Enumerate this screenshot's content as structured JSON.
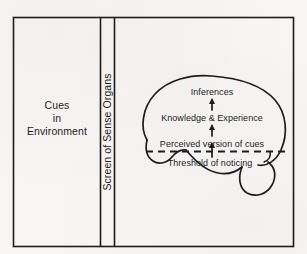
{
  "figure": {
    "ink_color": "#1d1d1d",
    "background_color": "#f7f6f4"
  },
  "panels": {
    "environment": {
      "name": "Cues in Environment",
      "lines": [
        "Cues",
        "in",
        "Environment"
      ]
    },
    "sense_organs": {
      "label": "Screen of Sense Organs",
      "orientation": "vertical-bottom-to-top"
    },
    "mind": {
      "shape": "brain-outline",
      "labels": {
        "inferences": "Inferences",
        "knowledge": "Knowledge & Experience",
        "perceived": "Perceived version of cues",
        "threshold": "Threshold of noticing"
      },
      "arrows": [
        {
          "name": "arrow-perceived-to-knowledge",
          "direction": "up"
        },
        {
          "name": "arrow-knowledge-to-inferences",
          "direction": "up"
        },
        {
          "name": "arrow-through-threshold",
          "direction": "up"
        }
      ],
      "threshold_line_style": "dashed"
    }
  }
}
